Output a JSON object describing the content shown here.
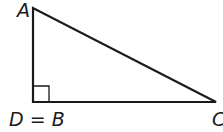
{
  "diagram": {
    "type": "right-triangle",
    "labels": {
      "top": "A",
      "bottom_left": "D = B",
      "bottom_right": "C"
    },
    "right_angle_at": "D = B",
    "stroke_color": "#1a1a1a",
    "background": "#ffffff"
  }
}
